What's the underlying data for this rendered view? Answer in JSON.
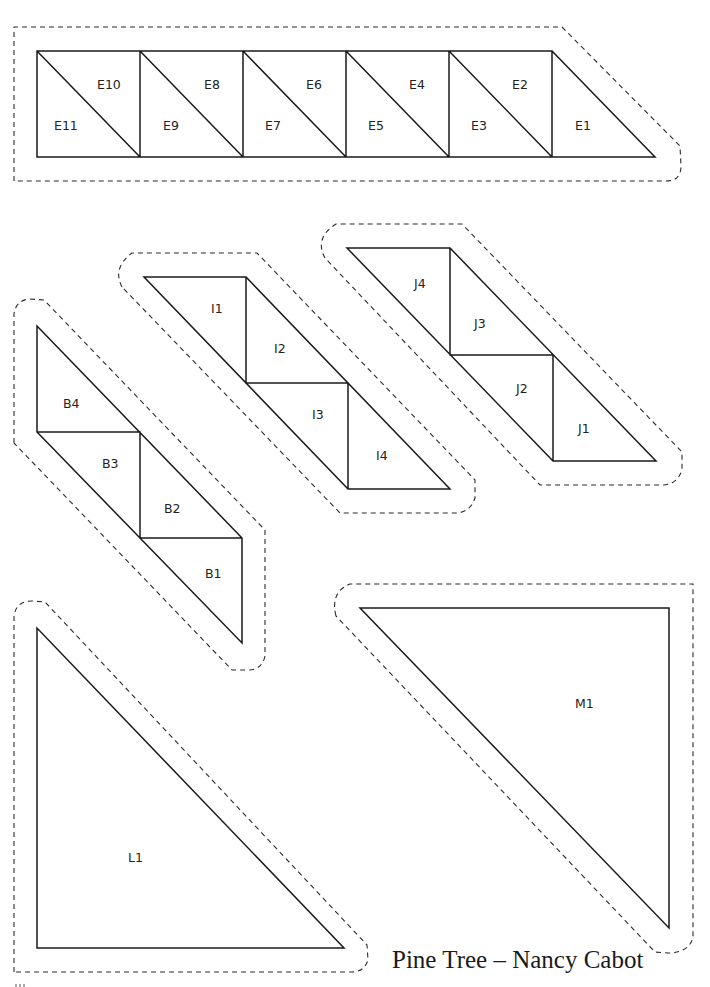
{
  "title": "Pine Tree – Nancy Cabot",
  "colors": {
    "line": "#1a1a1a",
    "background": "#ffffff"
  },
  "pieces": {
    "E": {
      "strip": "E",
      "labels": [
        "E1",
        "E2",
        "E3",
        "E4",
        "E5",
        "E6",
        "E7",
        "E8",
        "E9",
        "E10",
        "E11"
      ]
    },
    "I": {
      "strip": "I",
      "labels": [
        "I1",
        "I2",
        "I3",
        "I4"
      ]
    },
    "J": {
      "strip": "J",
      "labels": [
        "J1",
        "J2",
        "J3",
        "J4"
      ]
    },
    "B": {
      "strip": "B",
      "labels": [
        "B1",
        "B2",
        "B3",
        "B4"
      ]
    },
    "L": {
      "labels": [
        "L1"
      ]
    },
    "M": {
      "labels": [
        "M1"
      ]
    }
  }
}
